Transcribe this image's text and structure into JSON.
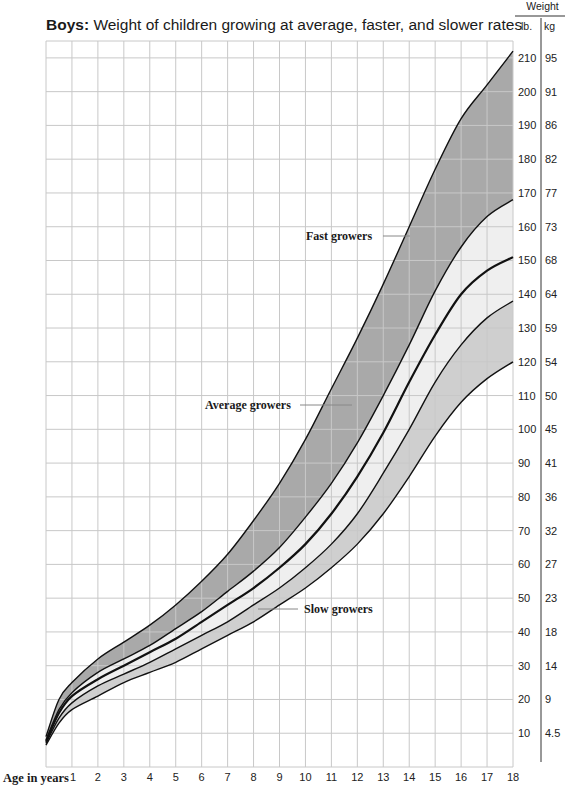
{
  "chart_data": {
    "type": "area",
    "title_bold": "Boys:",
    "title_rest": " Weight of children growing at average, faster, and slower rates",
    "title": "Boys: Weight of children growing at average, faster, and slower rates",
    "xlabel": "Age in years",
    "ylabel": "Weight",
    "y_units": [
      "lb.",
      "kg"
    ],
    "x_ticks": [
      1,
      2,
      3,
      4,
      5,
      6,
      7,
      8,
      9,
      10,
      11,
      12,
      13,
      14,
      15,
      16,
      17,
      18
    ],
    "y_ticks_lb": [
      10,
      20,
      30,
      40,
      50,
      60,
      70,
      80,
      90,
      100,
      110,
      120,
      130,
      140,
      150,
      160,
      170,
      180,
      190,
      200,
      210
    ],
    "y_ticks_kg": [
      "4.5",
      "9",
      "14",
      "18",
      "23",
      "27",
      "32",
      "36",
      "41",
      "45",
      "50",
      "54",
      "59",
      "64",
      "68",
      "73",
      "77",
      "82",
      "86",
      "91",
      "95"
    ],
    "xlim": [
      0,
      18
    ],
    "ylim": [
      0,
      215
    ],
    "grid": true,
    "x": [
      0,
      0.5,
      1,
      2,
      3,
      4,
      5,
      6,
      7,
      8,
      9,
      10,
      11,
      12,
      13,
      14,
      15,
      16,
      17,
      18
    ],
    "series": [
      {
        "name": "Upper (fast) limit",
        "values": [
          9,
          20,
          25,
          32,
          37,
          42,
          48,
          55,
          63,
          73,
          84,
          97,
          112,
          127,
          143,
          160,
          177,
          192,
          202,
          212
        ]
      },
      {
        "name": "Upper average",
        "values": [
          8,
          17,
          22,
          28,
          32,
          36,
          41,
          46,
          52,
          58,
          65,
          74,
          84,
          96,
          110,
          125,
          141,
          154,
          163,
          168
        ]
      },
      {
        "name": "Average",
        "values": [
          7.5,
          16,
          21,
          26,
          30,
          34,
          38,
          43,
          48,
          53,
          59,
          66,
          75,
          86,
          99,
          114,
          128,
          140,
          147,
          151
        ]
      },
      {
        "name": "Lower average",
        "values": [
          7,
          14.5,
          19,
          24,
          27.5,
          31,
          35,
          39,
          43,
          48,
          53,
          59,
          66,
          75,
          87,
          100,
          114,
          125,
          133,
          138
        ]
      },
      {
        "name": "Lower (slow) limit",
        "values": [
          6.5,
          13,
          17,
          21,
          25,
          28,
          31,
          35,
          39,
          43,
          48,
          53,
          59,
          66,
          75,
          86,
          98,
          108,
          115,
          120
        ]
      }
    ],
    "bands": [
      {
        "name": "Fast growers",
        "between": [
          "Upper (fast) limit",
          "Upper average"
        ],
        "color": "#a9a9a9"
      },
      {
        "name": "Average growers",
        "between": [
          "Upper average",
          "Lower average"
        ],
        "color": "#efefef"
      },
      {
        "name": "Slow growers",
        "between": [
          "Lower average",
          "Lower (slow) limit"
        ],
        "color": "#cfcfcf"
      }
    ],
    "annotations": [
      {
        "text": "Fast growers",
        "x_label_px": 306,
        "y_px": 236
      },
      {
        "text": "Average growers",
        "x_label_px": 205,
        "y_px": 405
      },
      {
        "text": "Slow growers",
        "x_label_px": 304,
        "y_px": 609
      }
    ]
  },
  "header": {
    "weight_label": "Weight",
    "lb_label": "lb.",
    "kg_label": "kg"
  },
  "colors": {
    "grid": "#c8c8c8",
    "curve": "#111111",
    "fast_band": "#a9a9a9",
    "average_band": "#efefef",
    "slow_band": "#cfcfcf"
  }
}
